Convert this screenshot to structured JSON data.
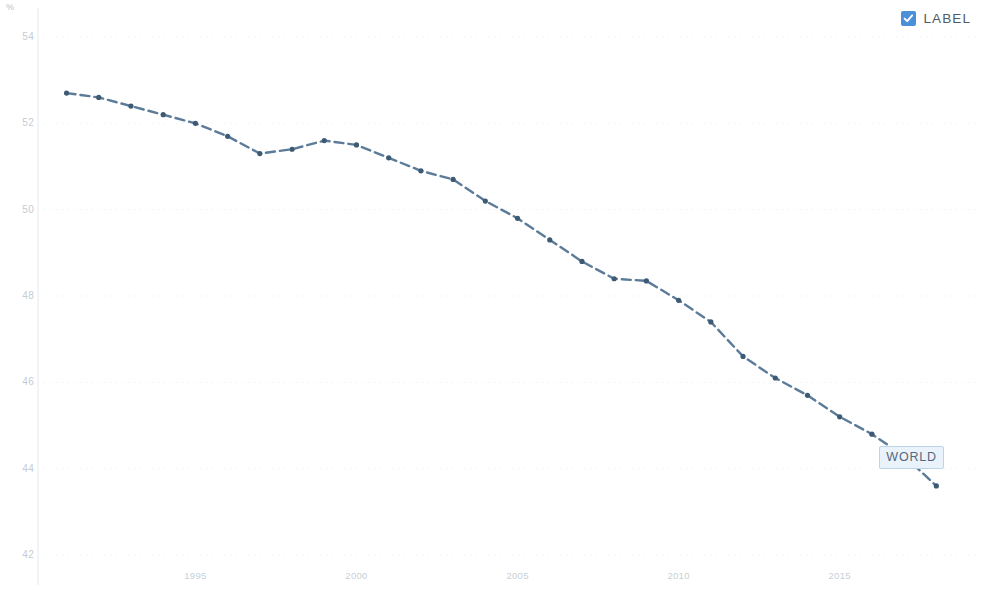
{
  "chart_data": {
    "type": "line",
    "title": "",
    "subtitle": "",
    "xlabel": "",
    "ylabel": "%",
    "unit_label": "%",
    "xlim": [
      1990.3,
      2019.2
    ],
    "ylim": [
      42,
      54
    ],
    "xticks": [
      "1995",
      "2000",
      "2005",
      "2010",
      "2015"
    ],
    "xtick_values": [
      1995,
      2000,
      2005,
      2010,
      2015
    ],
    "yticks": [
      "54",
      "52",
      "50",
      "48",
      "46",
      "44",
      "42"
    ],
    "ytick_values": [
      54,
      52,
      50,
      48,
      46,
      44,
      42
    ],
    "grid": true,
    "grid_style": "dotted-horizontal",
    "legend_position": "top-right",
    "line_color": "#5b7b98",
    "marker_color": "#3d5a75",
    "line_style": "dashed",
    "series": [
      {
        "name": "LABEL",
        "annotation": "WORLD",
        "x": [
          1991,
          1992,
          1993,
          1994,
          1995,
          1996,
          1997,
          1998,
          1999,
          2000,
          2001,
          2002,
          2003,
          2004,
          2005,
          2006,
          2007,
          2008,
          2009,
          2010,
          2011,
          2012,
          2013,
          2014,
          2015,
          2016,
          2017,
          2018
        ],
        "values": [
          52.7,
          52.6,
          52.4,
          52.2,
          52.0,
          51.7,
          51.3,
          51.4,
          51.6,
          51.5,
          51.2,
          50.9,
          50.7,
          50.2,
          49.8,
          49.3,
          48.8,
          48.4,
          48.35,
          47.9,
          47.4,
          46.6,
          46.1,
          45.7,
          45.2,
          44.8,
          44.3,
          43.6
        ]
      }
    ]
  },
  "legend": {
    "label": "LABEL",
    "checked": true,
    "checkbox_color": "#4a8fd8"
  },
  "annotation": {
    "label": "WORLD"
  }
}
